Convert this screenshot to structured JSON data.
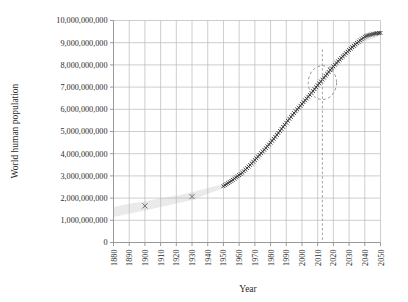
{
  "chart_data": {
    "type": "scatter",
    "title": "",
    "xlabel": "Year",
    "ylabel": "World human population",
    "xlim": [
      1880,
      2050
    ],
    "ylim": [
      0,
      10000000000
    ],
    "xticks": [
      1880,
      1890,
      1900,
      1910,
      1920,
      1930,
      1940,
      1950,
      1960,
      1970,
      1980,
      1990,
      2000,
      2010,
      2020,
      2030,
      2040,
      2050
    ],
    "xtick_labels": [
      "1880",
      "1890",
      "1900",
      "1910",
      "1920",
      "1930",
      "1940",
      "1950",
      "1960",
      "1970",
      "1980",
      "1990",
      "2000",
      "2010",
      "2020",
      "2030",
      "2040",
      "2050"
    ],
    "yticks": [
      0,
      1000000000,
      2000000000,
      3000000000,
      4000000000,
      5000000000,
      6000000000,
      7000000000,
      8000000000,
      9000000000,
      10000000000
    ],
    "ytick_labels": [
      "0",
      "1,000,000,000",
      "2,000,000,000",
      "3,000,000,000",
      "4,000,000,000",
      "5,000,000,000",
      "6,000,000,000",
      "7,000,000,000",
      "8,000,000,000",
      "9,000,000,000",
      "10,000,000,000"
    ],
    "grid": true,
    "legend": "none",
    "series": [
      {
        "name": "Sparse historical estimates",
        "marker": "x",
        "color": "#6e6e6e",
        "x": [
          1900,
          1930
        ],
        "values": [
          1650000000,
          2070000000
        ]
      },
      {
        "name": "Annual population (dense x markers)",
        "marker": "x",
        "color": "#3a3a3a",
        "x": [
          1950,
          1951,
          1952,
          1953,
          1954,
          1955,
          1956,
          1957,
          1958,
          1959,
          1960,
          1961,
          1962,
          1963,
          1964,
          1965,
          1966,
          1967,
          1968,
          1969,
          1970,
          1971,
          1972,
          1973,
          1974,
          1975,
          1976,
          1977,
          1978,
          1979,
          1980,
          1981,
          1982,
          1983,
          1984,
          1985,
          1986,
          1987,
          1988,
          1989,
          1990,
          1991,
          1992,
          1993,
          1994,
          1995,
          1996,
          1997,
          1998,
          1999,
          2000,
          2001,
          2002,
          2003,
          2004,
          2005,
          2006,
          2007,
          2008,
          2009,
          2010,
          2011,
          2012,
          2013,
          2014,
          2015,
          2016,
          2017,
          2018,
          2019,
          2020,
          2021,
          2022,
          2023,
          2024,
          2025,
          2026,
          2027,
          2028,
          2029,
          2030,
          2031,
          2032,
          2033,
          2034,
          2035,
          2036,
          2037,
          2038,
          2039,
          2040,
          2041,
          2042,
          2043,
          2044,
          2045,
          2046,
          2047,
          2048,
          2049,
          2050
        ],
        "values": [
          2536000000,
          2584000000,
          2630000000,
          2677000000,
          2724000000,
          2773000000,
          2824000000,
          2878000000,
          2933000000,
          2986000000,
          3035000000,
          3083000000,
          3141000000,
          3210000000,
          3281000000,
          3351000000,
          3421000000,
          3491000000,
          3563000000,
          3638000000,
          3713000000,
          3791000000,
          3868000000,
          3945000000,
          4022000000,
          4100000000,
          4177000000,
          4254000000,
          4333000000,
          4415000000,
          4498000000,
          4583000000,
          4670000000,
          4757000000,
          4844000000,
          4933000000,
          5024000000,
          5116000000,
          5209000000,
          5302000000,
          5394000000,
          5484000000,
          5572000000,
          5659000000,
          5744000000,
          5828000000,
          5912000000,
          5995000000,
          6077000000,
          6159000000,
          6240000000,
          6322000000,
          6404000000,
          6486000000,
          6569000000,
          6652000000,
          6736000000,
          6821000000,
          6907000000,
          6993000000,
          7080000000,
          7167000000,
          7254000000,
          7340000000,
          7426000000,
          7512000000,
          7597000000,
          7682000000,
          7765000000,
          7847000000,
          7928000000,
          8007000000,
          8085000000,
          8162000000,
          8237000000,
          8311000000,
          8384000000,
          8456000000,
          8527000000,
          8597000000,
          8665000000,
          8732000000,
          8798000000,
          8862000000,
          8925000000,
          8987000000,
          9047000000,
          9106000000,
          9163000000,
          9219000000,
          9273000000,
          9306000000,
          9330000000,
          9352000000,
          9372000000,
          9390000000,
          9405000000,
          9418000000,
          9428000000,
          9436000000,
          9441000000
        ]
      }
    ],
    "uncertainty_band": {
      "name": "Uncertainty / projection band",
      "color": "#e6e6e6",
      "x": [
        1880,
        1890,
        1900,
        1910,
        1920,
        1930,
        1940,
        1950,
        1960,
        1970,
        1980,
        1990,
        2000,
        2010,
        2020,
        2030,
        2040,
        2050
      ],
      "upper": [
        1600000000,
        1740000000,
        1860000000,
        1990000000,
        2110000000,
        2260000000,
        2450000000,
        2620000000,
        3120000000,
        3800000000,
        4590000000,
        5490000000,
        6340000000,
        7190000000,
        8030000000,
        8830000000,
        9280000000,
        9540000000
      ],
      "lower": [
        1150000000,
        1290000000,
        1440000000,
        1600000000,
        1760000000,
        1920000000,
        2190000000,
        2460000000,
        2960000000,
        3640000000,
        4420000000,
        5310000000,
        6150000000,
        6980000000,
        7800000000,
        8570000000,
        9050000000,
        9320000000
      ]
    },
    "annotations": [
      {
        "type": "ellipse",
        "name": "present-day-highlight-ellipse",
        "center_x": 2013,
        "center_y": 7200000000,
        "radius_x_years": 9,
        "radius_y_population": 760000000,
        "style": "dashed",
        "color": "#8a8a8a"
      },
      {
        "type": "vline",
        "name": "present-day-marker-line",
        "x": 2013,
        "y_top": 8700000000,
        "y_bottom": 0,
        "style": "dashed",
        "color": "#8a8a8a"
      }
    ]
  },
  "colors": {
    "grid": "#b9b9b9",
    "axis": "#8f8f8f",
    "text": "#2b2b2b",
    "marker_dense": "#3a3a3a",
    "marker_sparse": "#6e6e6e",
    "band": "#e6e6e6",
    "annotation": "#8a8a8a",
    "background": "#ffffff"
  }
}
